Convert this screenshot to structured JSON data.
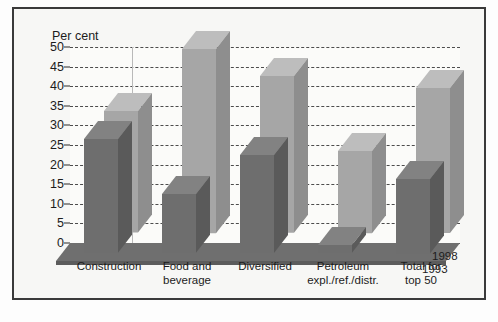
{
  "chart_data": {
    "type": "bar",
    "title": "",
    "ylabel": "Per cent",
    "xlabel": "",
    "ylim": [
      0,
      50
    ],
    "yticks": [
      0,
      5,
      10,
      15,
      20,
      25,
      30,
      35,
      40,
      45,
      50
    ],
    "grid": true,
    "legend_position": "bottom-right",
    "three_d": true,
    "categories": [
      "Construction",
      "Food and beverage",
      "Diversified",
      "Petroleum expl./ref./distr.",
      "Total for top 50"
    ],
    "category_lines": [
      [
        "Construction"
      ],
      [
        "Food and",
        "beverage"
      ],
      [
        "Diversified"
      ],
      [
        "Petroleum",
        "expl./ref./distr."
      ],
      [
        "Total for",
        "top 50"
      ]
    ],
    "series": [
      {
        "name": "1998",
        "color": "#a6a6a6",
        "values": [
          31,
          47,
          40,
          21,
          37
        ]
      },
      {
        "name": "1993",
        "color": "#6e6e6e",
        "values": [
          29,
          15,
          25,
          2,
          19
        ]
      }
    ]
  },
  "legend": {
    "entries": [
      {
        "label": "1998"
      },
      {
        "label": "1993"
      }
    ]
  },
  "colors": {
    "series_1998_front": "#a6a6a6",
    "series_1998_side": "#8e8e8e",
    "series_1998_top": "#bdbdbd",
    "series_1993_front": "#6e6e6e",
    "series_1993_side": "#5a5a5a",
    "series_1993_top": "#828282",
    "frame_border": "#3a3a3a",
    "grid": "#4c4c4c",
    "floor": "#777777",
    "background": "#f7f7f5"
  }
}
